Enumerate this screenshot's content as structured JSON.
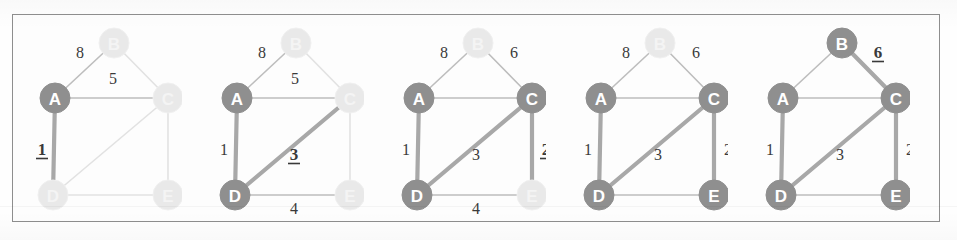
{
  "figure": {
    "panel_count": 5,
    "node_labels": [
      "A",
      "B",
      "C",
      "D",
      "E"
    ],
    "colors": {
      "node_selected": "#8f8f8f",
      "node_unselected": "#e9e9e9",
      "node_selected_text": "#ffffff",
      "node_unselected_text": "#f4f4f4",
      "edge_normal": "#bdbdbd",
      "edge_faint": "#e2e2e2",
      "edge_highlight": "#a8a8a8",
      "label_text": "#3a3a3a",
      "frame_border": "#8e8e8e",
      "background": "#fdfdfd"
    }
  },
  "chart_data": {
    "type": "diagram",
    "graph": {
      "nodes": [
        {
          "id": "A",
          "x": 55,
          "y": 98
        },
        {
          "id": "B",
          "x": 114,
          "y": 43
        },
        {
          "id": "C",
          "x": 168,
          "y": 98
        },
        {
          "id": "D",
          "x": 53,
          "y": 195
        },
        {
          "id": "E",
          "x": 168,
          "y": 195
        }
      ],
      "edges": [
        {
          "from": "A",
          "to": "B",
          "weight": 8
        },
        {
          "from": "B",
          "to": "C",
          "weight": 6
        },
        {
          "from": "A",
          "to": "C",
          "weight": 5
        },
        {
          "from": "A",
          "to": "D",
          "weight": 1
        },
        {
          "from": "D",
          "to": "C",
          "weight": 3
        },
        {
          "from": "C",
          "to": "E",
          "weight": 2
        },
        {
          "from": "D",
          "to": "E",
          "weight": 4
        }
      ]
    },
    "panels": [
      {
        "index": 1,
        "selected_nodes": [
          "A"
        ],
        "tree_edges": [],
        "new_edge": "A-D",
        "visible_labels": [
          {
            "edge": "A-B",
            "text": "8",
            "emphasis": "normal"
          },
          {
            "edge": "A-C",
            "text": "5",
            "emphasis": "normal"
          },
          {
            "edge": "A-D",
            "text": "1",
            "emphasis": "bold-underline"
          }
        ]
      },
      {
        "index": 2,
        "selected_nodes": [
          "A",
          "D"
        ],
        "tree_edges": [
          "A-D"
        ],
        "new_edge": "D-C",
        "visible_labels": [
          {
            "edge": "A-B",
            "text": "8",
            "emphasis": "normal"
          },
          {
            "edge": "A-C",
            "text": "5",
            "emphasis": "normal"
          },
          {
            "edge": "A-D",
            "text": "1",
            "emphasis": "normal"
          },
          {
            "edge": "D-C",
            "text": "3",
            "emphasis": "bold-underline"
          },
          {
            "edge": "D-E",
            "text": "4",
            "emphasis": "normal"
          }
        ]
      },
      {
        "index": 3,
        "selected_nodes": [
          "A",
          "C",
          "D"
        ],
        "tree_edges": [
          "A-D",
          "D-C"
        ],
        "new_edge": "C-E",
        "visible_labels": [
          {
            "edge": "A-B",
            "text": "8",
            "emphasis": "normal"
          },
          {
            "edge": "B-C",
            "text": "6",
            "emphasis": "normal"
          },
          {
            "edge": "A-D",
            "text": "1",
            "emphasis": "normal"
          },
          {
            "edge": "D-C",
            "text": "3",
            "emphasis": "normal"
          },
          {
            "edge": "C-E",
            "text": "2",
            "emphasis": "bold-underline"
          },
          {
            "edge": "D-E",
            "text": "4",
            "emphasis": "normal"
          }
        ]
      },
      {
        "index": 4,
        "selected_nodes": [
          "A",
          "C",
          "D",
          "E"
        ],
        "tree_edges": [
          "A-D",
          "D-C",
          "C-E"
        ],
        "new_edge": null,
        "visible_labels": [
          {
            "edge": "A-B",
            "text": "8",
            "emphasis": "normal"
          },
          {
            "edge": "B-C",
            "text": "6",
            "emphasis": "normal"
          },
          {
            "edge": "A-D",
            "text": "1",
            "emphasis": "normal"
          },
          {
            "edge": "D-C",
            "text": "3",
            "emphasis": "normal"
          },
          {
            "edge": "C-E",
            "text": "2",
            "emphasis": "normal"
          }
        ]
      },
      {
        "index": 5,
        "selected_nodes": [
          "A",
          "B",
          "C",
          "D",
          "E"
        ],
        "tree_edges": [
          "A-D",
          "D-C",
          "C-E",
          "B-C"
        ],
        "new_edge": "B-C",
        "visible_labels": [
          {
            "edge": "B-C",
            "text": "6",
            "emphasis": "bold-underline"
          },
          {
            "edge": "A-D",
            "text": "1",
            "emphasis": "normal"
          },
          {
            "edge": "D-C",
            "text": "3",
            "emphasis": "normal"
          },
          {
            "edge": "C-E",
            "text": "2",
            "emphasis": "normal"
          }
        ]
      }
    ]
  }
}
